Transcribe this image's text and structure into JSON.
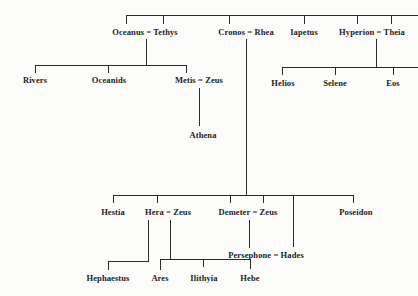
{
  "diagram": {
    "type": "genealogy-tree",
    "generations": [
      {
        "level": 1,
        "nodes": [
          {
            "id": "oceanus_tethys",
            "label": "Oceanus = Tethys"
          },
          {
            "id": "cronos_rhea",
            "label": "Cronos = Rhea"
          },
          {
            "id": "iapetus",
            "label": "Iapetus"
          },
          {
            "id": "hyperion_theia",
            "label": "Hyperion = Theia"
          }
        ]
      },
      {
        "level": 2,
        "nodes": [
          {
            "id": "rivers",
            "label": "Rivers",
            "parent": "oceanus_tethys"
          },
          {
            "id": "oceanids",
            "label": "Oceanids",
            "parent": "oceanus_tethys"
          },
          {
            "id": "metis_zeus",
            "label": "Metis = Zeus",
            "parent": "oceanus_tethys"
          },
          {
            "id": "helios",
            "label": "Helios",
            "parent": "hyperion_theia"
          },
          {
            "id": "selene",
            "label": "Selene",
            "parent": "hyperion_theia"
          },
          {
            "id": "eos",
            "label": "Eos",
            "parent": "hyperion_theia"
          }
        ]
      },
      {
        "level": 3,
        "nodes": [
          {
            "id": "athena",
            "label": "Athena",
            "parent": "metis_zeus"
          }
        ]
      },
      {
        "level": 4,
        "nodes": [
          {
            "id": "hestia",
            "label": "Hestia",
            "parent": "cronos_rhea"
          },
          {
            "id": "hera_zeus",
            "label": "Hera = Zeus",
            "parent": "cronos_rhea"
          },
          {
            "id": "demeter_zeus",
            "label": "Demeter = Zeus",
            "parent": "cronos_rhea"
          },
          {
            "id": "poseidon",
            "label": "Poseidon",
            "parent": "cronos_rhea"
          }
        ]
      },
      {
        "level": 5,
        "nodes": [
          {
            "id": "persephone_hades",
            "label": "Persephone = Hades",
            "parent": "demeter_zeus"
          }
        ]
      },
      {
        "level": 6,
        "nodes": [
          {
            "id": "hephaestus",
            "label": "Hephaestus",
            "parent": "hera"
          },
          {
            "id": "ares",
            "label": "Ares",
            "parent": "hera_zeus"
          },
          {
            "id": "ilithyia",
            "label": "Ilithyia",
            "parent": "hera_zeus"
          },
          {
            "id": "hebe",
            "label": "Hebe",
            "parent": "hera_zeus"
          }
        ]
      }
    ],
    "labels": {
      "oceanus_tethys": "Oceanus = Tethys",
      "cronos_rhea": "Cronos = Rhea",
      "iapetus": "Iapetus",
      "hyperion_theia": "Hyperion = Theia",
      "rivers": "Rivers",
      "oceanids": "Oceanids",
      "metis_zeus": "Metis = Zeus",
      "athena": "Athena",
      "helios": "Helios",
      "selene": "Selene",
      "eos": "Eos",
      "hestia": "Hestia",
      "hera_zeus": "Hera = Zeus",
      "demeter_zeus": "Demeter = Zeus",
      "poseidon": "Poseidon",
      "persephone_hades": "Persephone = Hades",
      "hephaestus": "Hephaestus",
      "ares": "Ares",
      "ilithyia": "Ilithyia",
      "hebe": "Hebe"
    },
    "colors": {
      "background": "#fbfbf9",
      "ink": "#1e1e1e"
    }
  }
}
